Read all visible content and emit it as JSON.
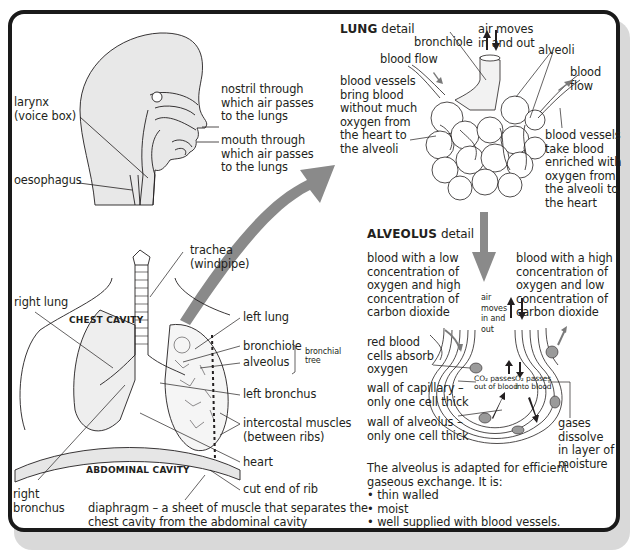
{
  "head_section": {
    "labels": {
      "larynx": [
        "larynx",
        "(voice box)"
      ],
      "oesophagus": "oesophagus",
      "nostril": [
        "nostril through",
        "which air passes",
        "to the lungs"
      ],
      "mouth": [
        "mouth through",
        "which air passes",
        "to the lungs"
      ]
    }
  },
  "chest_section": {
    "cavity_labels": {
      "chest": "CHEST CAVITY",
      "abdominal": "ABDOMINAL CAVITY"
    },
    "labels": {
      "trachea": [
        "trachea",
        "(windpipe)"
      ],
      "right_lung": "right lung",
      "left_lung": "left lung",
      "bronchiole": "bronchiole",
      "alveolus": "alveolus",
      "bronchial_tree": [
        "bronchial",
        "tree"
      ],
      "left_bronchus": "left bronchus",
      "intercostal": [
        "intercostal muscles",
        "(between ribs)"
      ],
      "heart": "heart",
      "cut_end_rib": "cut end of rib",
      "right_bronchus": [
        "right",
        "bronchus"
      ],
      "diaphragm": [
        "diaphragm – a sheet of muscle that separates the",
        "chest cavity from the abdominal cavity"
      ]
    }
  },
  "lung_detail": {
    "title_bold": "LUNG",
    "title_rest": " detail",
    "labels": {
      "bronchiole": "bronchiole",
      "air_moves": [
        "air moves",
        "in and out"
      ],
      "alveoli": "alveoli",
      "blood_flow_in": "blood flow",
      "blood_flow_out": [
        "blood",
        "flow"
      ],
      "vessels_in": [
        "blood vessels",
        "bring blood",
        "without much",
        "oxygen from",
        "the heart to",
        "the alveoli"
      ],
      "vessels_out": [
        "blood vessels",
        "take blood",
        "enriched with",
        "oxygen from",
        "the alveoli to",
        "the heart"
      ]
    }
  },
  "alveolus_detail": {
    "title_bold": "ALVEOLUS",
    "title_rest": " detail",
    "labels": {
      "low_o2": [
        "blood with a low",
        "concentration of",
        "oxygen and high",
        "concentration of",
        "carbon dioxide"
      ],
      "high_o2": [
        "blood with a high",
        "concentration of",
        "oxygen and low",
        "concentration of",
        "carbon dioxide"
      ],
      "air_moves": [
        "air",
        "moves",
        "in and",
        "out"
      ],
      "red_blood": [
        "red blood",
        "cells absorb",
        "oxygen"
      ],
      "co2_passes": [
        "CO₂ passes",
        "out of blood"
      ],
      "o2_passes": [
        "O₂ passes",
        "into blood"
      ],
      "capillary_wall": [
        "wall of capillary –",
        "only one cell thick"
      ],
      "alveolus_wall": [
        "wall of alveolus –",
        "only one cell thick"
      ],
      "gases_dissolve": [
        "gases",
        "dissolve",
        "in layer of",
        "moisture"
      ]
    },
    "summary": {
      "intro": [
        "The alveolus is adapted for efficient",
        "gaseous exchange. It is:"
      ],
      "bullets": [
        "• thin walled",
        "• moist",
        "• well supplied with blood vessels."
      ]
    }
  },
  "colors": {
    "frame": "#1a1a1a",
    "shading": "#e6e6e6",
    "arrow_grey": "#8a8a8a",
    "line": "#231f20"
  }
}
